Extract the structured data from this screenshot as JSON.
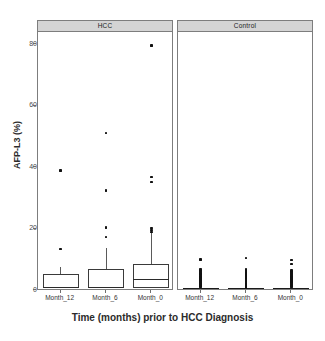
{
  "figure": {
    "top_clipped_caption": "",
    "background": "#ffffff",
    "point_color": "#111111",
    "box_stroke": "#3a3a3a",
    "strip_fill": "#d4d4d4"
  },
  "chart_data": {
    "type": "box",
    "title": "",
    "xlabel": "Time (months) prior to HCC Diagnosis",
    "ylabel": "AFP-L3 (%)",
    "ylim": [
      -2,
      84
    ],
    "yticks": [
      0,
      20,
      40,
      60,
      80
    ],
    "ytick_labels": [
      "0",
      "20",
      "40",
      "60",
      "80"
    ],
    "grid": false,
    "legend": "none",
    "facet_labels": [
      "HCC",
      "Control"
    ],
    "categories": [
      "Month_12",
      "Month_6",
      "Month_0"
    ],
    "panels": [
      {
        "name": "HCC",
        "boxes": [
          {
            "category": "Month_12",
            "min": 0.0,
            "q1": 0.2,
            "median": 0.4,
            "q3": 5.0,
            "max": 7.0,
            "outliers": [
              38.5,
              13.0
            ]
          },
          {
            "category": "Month_6",
            "min": 0.0,
            "q1": 0.3,
            "median": 0.5,
            "q3": 6.4,
            "max": 13.2,
            "outliers": [
              50.8,
              32.0,
              20.0,
              17.0
            ]
          },
          {
            "category": "Month_0",
            "min": 0.0,
            "q1": 0.3,
            "median": 3.0,
            "q3": 8.0,
            "max": 18.8,
            "outliers": [
              79.2,
              36.5,
              34.8,
              19.8,
              19.2,
              18.6
            ]
          }
        ]
      },
      {
        "name": "Control",
        "boxes": [
          {
            "category": "Month_12",
            "min": 0.0,
            "q1": 0.0,
            "median": 0.0,
            "q3": 0.0,
            "max": 0.0,
            "outliers": [
              9.6,
              6.6,
              6.0,
              5.5,
              5.1,
              4.8,
              4.5,
              4.2,
              4.0,
              3.8,
              3.5,
              3.2,
              3.0,
              2.7,
              2.4,
              2.1,
              1.8,
              1.5,
              1.2,
              0.9,
              0.6
            ]
          },
          {
            "category": "Month_6",
            "min": 0.0,
            "q1": 0.0,
            "median": 0.0,
            "q3": 0.0,
            "max": 0.0,
            "outliers": [
              10.1,
              6.3,
              5.8,
              5.4,
              5.0,
              4.7,
              4.4,
              4.1,
              3.8,
              3.5,
              3.2,
              2.9,
              2.6,
              2.3,
              2.0,
              1.7,
              1.4,
              1.1,
              0.8,
              0.5
            ]
          },
          {
            "category": "Month_0",
            "min": 0.0,
            "q1": 0.0,
            "median": 0.0,
            "q3": 0.0,
            "max": 0.0,
            "outliers": [
              9.4,
              8.1,
              6.2,
              5.7,
              5.3,
              4.9,
              4.6,
              4.3,
              4.0,
              3.7,
              3.4,
              3.1,
              2.8,
              2.5,
              2.2,
              1.9,
              1.6,
              1.3,
              1.0,
              0.7
            ]
          }
        ]
      }
    ]
  }
}
